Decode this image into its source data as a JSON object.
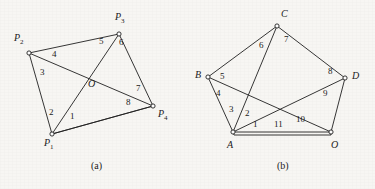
{
  "figure": {
    "background_color": "#f7f6f3",
    "stroke_color": "#1f1f1f",
    "panels": [
      {
        "id": "a",
        "caption": "(a)",
        "caption_pos": [
          91,
          163
        ],
        "type": "graph",
        "vertices": [
          {
            "name": "P1",
            "label": "P",
            "sub": "1",
            "x": 52,
            "y": 134,
            "label_pos": [
              44,
              142
            ]
          },
          {
            "name": "P2",
            "label": "P",
            "sub": "2",
            "x": 29,
            "y": 53,
            "label_pos": [
              14,
              36
            ]
          },
          {
            "name": "P3",
            "label": "P",
            "sub": "3",
            "x": 119,
            "y": 34,
            "label_pos": [
              117,
              14
            ]
          },
          {
            "name": "P4",
            "label": "P",
            "sub": "4",
            "x": 153,
            "y": 106,
            "label_pos": [
              158,
              112
            ]
          },
          {
            "name": "O",
            "label": "O",
            "sub": "",
            "x": 91,
            "y": 83,
            "label_pos": [
              88,
              82
            ],
            "is_crossing": true
          }
        ],
        "edges": [
          {
            "label": "1",
            "from": "P1",
            "to": "P4",
            "label_pos": [
              70,
              114
            ]
          },
          {
            "label": "2",
            "from": "P1",
            "to": "P3",
            "label_pos": [
              49,
              110
            ]
          },
          {
            "label": "3",
            "from": "P2",
            "to": "P1",
            "label_pos": [
              40,
              70
            ]
          },
          {
            "label": "4",
            "from": "P2",
            "to": "P3",
            "label_pos": [
              52,
              52
            ]
          },
          {
            "label": "5",
            "from": "P2",
            "to": "P4",
            "label_pos": [
              99,
              40
            ]
          },
          {
            "label": "6",
            "from": "P3",
            "to": "P1",
            "label_pos": [
              119,
              41
            ]
          },
          {
            "label": "7",
            "from": "P3",
            "to": "P4",
            "label_pos": [
              136,
              87
            ]
          },
          {
            "label": "8",
            "from": "P4",
            "to": "P1",
            "label_pos": [
              126,
              101
            ]
          }
        ]
      },
      {
        "id": "b",
        "caption": "(b)",
        "caption_pos": [
          277,
          163
        ],
        "type": "graph",
        "vertices": [
          {
            "name": "A",
            "label": "A",
            "sub": "",
            "x": 233,
            "y": 132,
            "label_pos": [
              227,
              140
            ]
          },
          {
            "name": "B",
            "label": "B",
            "sub": "",
            "x": 208,
            "y": 77,
            "label_pos": [
              195,
              70
            ]
          },
          {
            "name": "C",
            "label": "C",
            "sub": "",
            "x": 277,
            "y": 26,
            "label_pos": [
              281,
              10
            ]
          },
          {
            "name": "D",
            "label": "D",
            "sub": "",
            "x": 345,
            "y": 78,
            "label_pos": [
              352,
              72
            ]
          },
          {
            "name": "O",
            "label": "O",
            "sub": "",
            "x": 331,
            "y": 132,
            "label_pos": [
              332,
              140
            ]
          }
        ],
        "edges": [
          {
            "label": "1",
            "from": "A",
            "to": "D",
            "label_pos": [
              255,
              122
            ]
          },
          {
            "label": "2",
            "from": "A",
            "to": "C",
            "label_pos": [
              247,
              111
            ]
          },
          {
            "label": "3",
            "from": "A",
            "to": "B",
            "label_pos": [
              230,
              107
            ]
          },
          {
            "label": "4",
            "from": "B",
            "to": "O",
            "label_pos": [
              218,
              91
            ]
          },
          {
            "label": "5",
            "from": "B",
            "to": "C",
            "label_pos": [
              221,
              74
            ]
          },
          {
            "label": "6",
            "from": "C",
            "to": "A",
            "label_pos": [
              261,
              43
            ]
          },
          {
            "label": "7",
            "from": "C",
            "to": "D",
            "label_pos": [
              285,
              38
            ]
          },
          {
            "label": "8",
            "from": "D",
            "to": "C",
            "label_pos": [
              329,
              70
            ]
          },
          {
            "label": "9",
            "from": "D",
            "to": "A",
            "label_pos": [
              324,
              92
            ]
          },
          {
            "label": "10",
            "from": "D",
            "to": "O",
            "label_pos": [
              297,
              117
            ]
          },
          {
            "label": "11",
            "from": "A",
            "to": "O",
            "label_pos": [
              276,
              122
            ],
            "parallel": true
          }
        ]
      }
    ]
  }
}
